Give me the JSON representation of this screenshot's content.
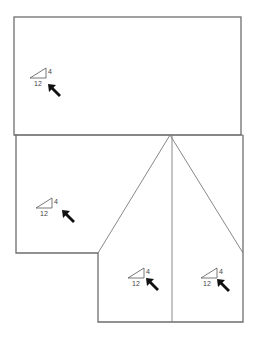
{
  "diagram": {
    "type": "roof-plan",
    "stroke_color": "#6e6e6e",
    "arrow_color": "#111111",
    "faces": [
      {
        "id": "top-face",
        "pitch": {
          "rise": "4",
          "run": "12"
        },
        "symbol_x": 30,
        "symbol_y": 68,
        "arrow_dir": "up-left"
      },
      {
        "id": "left-face",
        "pitch": {
          "rise": "4",
          "run": "12"
        },
        "symbol_x": 36,
        "symbol_y": 198,
        "arrow_dir": "up-left"
      },
      {
        "id": "lower-middle-face",
        "pitch": {
          "rise": "4",
          "run": "12"
        },
        "symbol_x": 128,
        "symbol_y": 268,
        "arrow_dir": "up-left"
      },
      {
        "id": "lower-right-face",
        "pitch": {
          "rise": "4",
          "run": "12"
        },
        "symbol_x": 201,
        "symbol_y": 268,
        "arrow_dir": "up-left"
      }
    ]
  }
}
